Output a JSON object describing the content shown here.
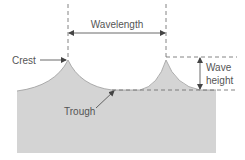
{
  "diagram": {
    "labels": {
      "wavelength": "Wavelength",
      "crest": "Crest",
      "trough": "Trough",
      "wave_height_line1": "Wave",
      "wave_height_line2": "height"
    },
    "colors": {
      "water_fill": "#d4d4d4",
      "wave_outline": "#9a9a9a",
      "line": "#555555",
      "text": "#555555",
      "background": "#ffffff"
    }
  }
}
